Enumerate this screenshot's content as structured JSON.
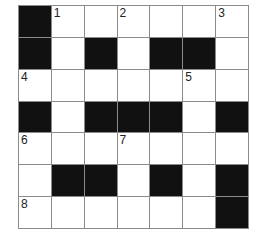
{
  "puzzle": {
    "rows": 7,
    "cols": 7,
    "colors": {
      "block": "#111111",
      "open": "#ffffff",
      "line": "#8a8a8a"
    },
    "grid": [
      [
        "#",
        "1",
        "",
        "2",
        "",
        "",
        "3"
      ],
      [
        "#",
        "",
        "#",
        "",
        "#",
        "#",
        ""
      ],
      [
        "4",
        "",
        "",
        "",
        "",
        "5",
        ""
      ],
      [
        "#",
        "",
        "#",
        "#",
        "#",
        "",
        "#"
      ],
      [
        "6",
        "",
        "",
        "7",
        "",
        "",
        ""
      ],
      [
        "",
        "#",
        "#",
        "",
        "#",
        "",
        "#"
      ],
      [
        "8",
        "",
        "",
        "",
        "",
        "",
        "#"
      ]
    ]
  }
}
